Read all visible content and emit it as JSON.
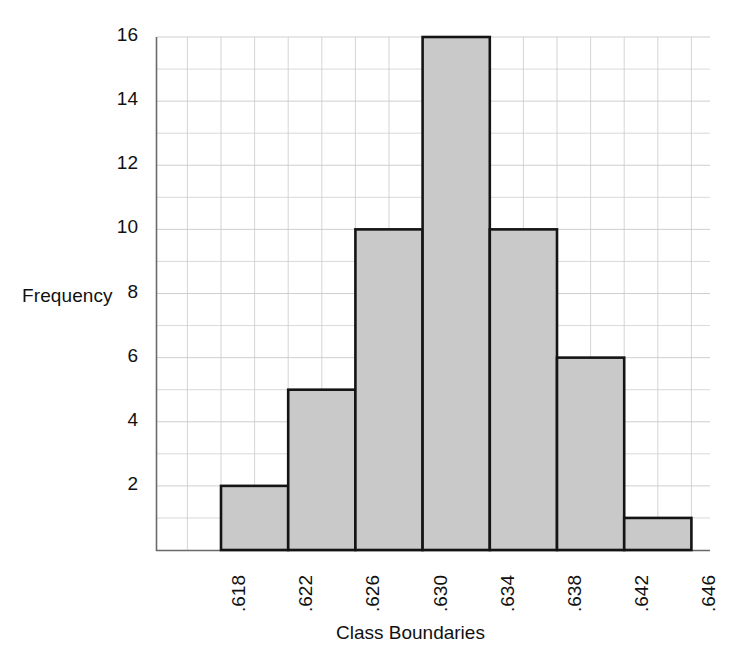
{
  "chart_data": {
    "type": "bar",
    "title": "",
    "subtitle": "",
    "xlabel": "Class Boundaries",
    "ylabel": "Frequency",
    "categories": [
      ".618-.622",
      ".622-.626",
      ".626-.630",
      ".630-.634",
      ".634-.638",
      ".638-.642",
      ".642-.646"
    ],
    "bin_edges": [
      0.618,
      0.622,
      0.626,
      0.63,
      0.634,
      0.638,
      0.642,
      0.646
    ],
    "values": [
      2,
      5,
      10,
      16,
      10,
      6,
      1
    ],
    "xtick_labels": [
      ".618",
      ".622",
      ".626",
      ".630",
      ".634",
      ".638",
      ".642",
      ".646"
    ],
    "ytick_labels": [
      "2",
      "4",
      "6",
      "8",
      "10",
      "12",
      "14",
      "16"
    ],
    "ytick_values": [
      2,
      4,
      6,
      8,
      10,
      12,
      14,
      16
    ],
    "ylim": [
      0,
      16
    ],
    "xlim": [
      0.618,
      0.646
    ],
    "grid": true,
    "grid_minor_y_step": 1,
    "legend": "none",
    "bar_fill_color": "#c9c9c9",
    "bar_edge_color": "#141414",
    "grid_color": "#c9c9c9",
    "axis_color": "#555555",
    "total_count": 50
  },
  "axes": {
    "y_axis_name": "frequency-axis",
    "x_axis_name": "class-boundaries-axis"
  }
}
